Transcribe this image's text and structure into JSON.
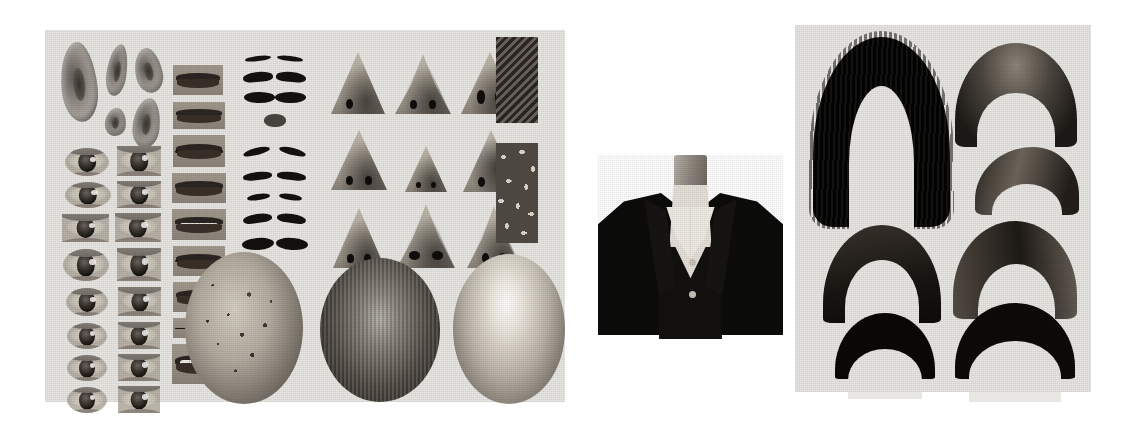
{
  "figure": {
    "background_color": "#ffffff",
    "panel_color": "#e9e7e3"
  },
  "panels": [
    {
      "id": "parts-sheet",
      "name": "Facial parts sheet",
      "x": 45,
      "y": 30,
      "width": 520,
      "height": 372
    },
    {
      "id": "torso-figure",
      "name": "Suited mannequin torso",
      "x": 598,
      "y": 155,
      "width": 185,
      "height": 180
    },
    {
      "id": "hair-sheet",
      "name": "Hairstyle sheet",
      "x": 795,
      "y": 25,
      "width": 296,
      "height": 367
    }
  ],
  "groups": {
    "ears": {
      "label": "Ears",
      "count": 5,
      "items": [
        {
          "label": "ear-large-left",
          "x": 16,
          "y": 12,
          "w": 36,
          "h": 80,
          "rot": -6
        },
        {
          "label": "ear-narrow",
          "x": 60,
          "y": 14,
          "w": 20,
          "h": 52,
          "rot": 8
        },
        {
          "label": "ear-round-upper",
          "x": 88,
          "y": 18,
          "w": 27,
          "h": 45,
          "rot": -12
        },
        {
          "label": "ear-small",
          "x": 58,
          "y": 78,
          "w": 21,
          "h": 28,
          "rot": 4
        },
        {
          "label": "ear-medium",
          "x": 86,
          "y": 68,
          "w": 27,
          "h": 50,
          "rot": 6
        }
      ]
    },
    "eyes": {
      "label": "Eyes",
      "count": 16,
      "columns": 2,
      "rows": 8,
      "items": [
        {
          "label": "eye-r1c1",
          "shape": "round"
        },
        {
          "label": "eye-r1c2",
          "shape": "rect"
        },
        {
          "label": "eye-r2c1",
          "shape": "round"
        },
        {
          "label": "eye-r2c2",
          "shape": "rect"
        },
        {
          "label": "eye-r3c1",
          "shape": "rect"
        },
        {
          "label": "eye-r3c2",
          "shape": "rect"
        },
        {
          "label": "eye-r4c1",
          "shape": "round"
        },
        {
          "label": "eye-r4c2",
          "shape": "rect"
        },
        {
          "label": "eye-r5c1",
          "shape": "round"
        },
        {
          "label": "eye-r5c2",
          "shape": "rect"
        },
        {
          "label": "eye-r6c1",
          "shape": "round"
        },
        {
          "label": "eye-r6c2",
          "shape": "rect"
        },
        {
          "label": "eye-r7c1",
          "shape": "round"
        },
        {
          "label": "eye-r7c2",
          "shape": "rect"
        },
        {
          "label": "eye-r8c1",
          "shape": "round"
        },
        {
          "label": "eye-r8c2",
          "shape": "rect"
        }
      ]
    },
    "mouths": {
      "label": "Mouths",
      "count": 9,
      "items": [
        {
          "label": "mouth-1-closed-dark",
          "style": "closed"
        },
        {
          "label": "mouth-2-closed-wide",
          "style": "closed"
        },
        {
          "label": "mouth-3-parted",
          "style": "parted"
        },
        {
          "label": "mouth-4-smile-teeth",
          "style": "teeth"
        },
        {
          "label": "mouth-5-broad-smile",
          "style": "teeth"
        },
        {
          "label": "mouth-6-dark-lips",
          "style": "closed"
        },
        {
          "label": "mouth-7-teeth-partial",
          "style": "teeth"
        },
        {
          "label": "mouth-8-thin-line",
          "style": "line"
        },
        {
          "label": "mouth-9-open-teeth",
          "style": "teeth"
        }
      ]
    },
    "eyebrows": {
      "label": "Eyebrows",
      "count": 9,
      "items": [
        {
          "label": "brow-pair-1-thin",
          "style": "thin"
        },
        {
          "label": "brow-pair-2-thick-arch",
          "style": "arch"
        },
        {
          "label": "brow-pair-3-bold-connected",
          "style": "flat"
        },
        {
          "label": "brow-pair-4-small-blob",
          "style": "blob"
        },
        {
          "label": "brow-pair-5-angled",
          "style": "thin"
        },
        {
          "label": "brow-pair-6-soft-arch",
          "style": "arch"
        },
        {
          "label": "brow-pair-7-short",
          "style": "thin"
        },
        {
          "label": "brow-pair-8-tapered",
          "style": "arch"
        },
        {
          "label": "brow-pair-9-heavy",
          "style": "flat"
        }
      ]
    },
    "noses": {
      "label": "Noses",
      "count": 9,
      "grid": "3x3",
      "items": [
        {
          "label": "nose-r1c1-narrow",
          "shape": "tall"
        },
        {
          "label": "nose-r1c2-broad",
          "shape": "wide"
        },
        {
          "label": "nose-r1c3-flared",
          "shape": "tall"
        },
        {
          "label": "nose-r2c1-straight",
          "shape": "tall"
        },
        {
          "label": "nose-r2c2-small",
          "shape": "tall"
        },
        {
          "label": "nose-r2c3-shadowed",
          "shape": "tall"
        },
        {
          "label": "nose-r3c1-pointed",
          "shape": "tall"
        },
        {
          "label": "nose-r3c2-wide-nostrils",
          "shape": "wide"
        },
        {
          "label": "nose-r3c3-angular",
          "shape": "wide"
        }
      ]
    },
    "swatches": {
      "label": "Texture swatches",
      "count": 2,
      "items": [
        {
          "label": "swatch-diagonal-hatch",
          "pattern": "hatch"
        },
        {
          "label": "swatch-scattered-glyphs",
          "pattern": "glyph"
        }
      ]
    },
    "heads": {
      "label": "Head base shapes",
      "count": 3,
      "items": [
        {
          "label": "head-textured-rough",
          "finish": "rough"
        },
        {
          "label": "head-brushed-metal",
          "finish": "brushed"
        },
        {
          "label": "head-smooth-specular",
          "finish": "smooth"
        }
      ]
    },
    "torso": {
      "label": "Torso",
      "parts": [
        {
          "label": "mannequin-neck"
        },
        {
          "label": "dress-shirt"
        },
        {
          "label": "shirt-collar"
        },
        {
          "label": "suit-vest"
        },
        {
          "label": "suit-jacket"
        },
        {
          "label": "jacket-lapel-left"
        },
        {
          "label": "jacket-lapel-right"
        },
        {
          "label": "shirt-button"
        }
      ]
    },
    "hair": {
      "label": "Hairstyles",
      "count": 7,
      "items": [
        {
          "label": "hair-long-black-curly",
          "style": "hairLong"
        },
        {
          "label": "hair-wavy-swept",
          "style": "hairWavy"
        },
        {
          "label": "hair-short-swoop",
          "style": "hairSwoop"
        },
        {
          "label": "hair-textured-arch",
          "style": "hairArch"
        },
        {
          "label": "hair-side-parted",
          "style": "hairSide"
        },
        {
          "label": "hair-small-bowl",
          "style": "hairBowl"
        },
        {
          "label": "hair-thick-black-short",
          "style": "hairShort"
        }
      ]
    }
  }
}
